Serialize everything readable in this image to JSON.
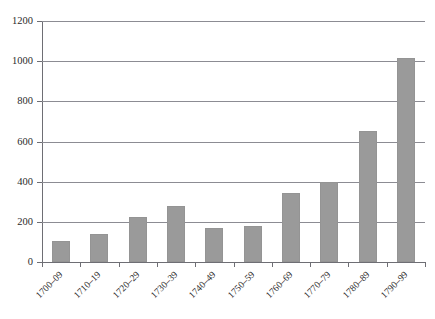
{
  "chart_data": {
    "type": "bar",
    "title": "",
    "subtitle": "",
    "xlabel": "",
    "ylabel": "",
    "ylim": [
      0,
      1200
    ],
    "yticks": [
      0,
      200,
      400,
      600,
      800,
      1000,
      1200
    ],
    "ytick_labels": [
      "0",
      "200",
      "400",
      "600",
      "800",
      "1000",
      "1200"
    ],
    "grid": true,
    "legend": "none",
    "bar_color": "#9a9a9a",
    "axis_color": "#6e6e74",
    "gridline_color": "#8c8c93",
    "categories": [
      "1700–09",
      "1710–19",
      "1720–29",
      "1730–39",
      "1740–49",
      "1750–59",
      "1760–69",
      "1770–79",
      "1780–89",
      "1790–99"
    ],
    "values": [
      105,
      140,
      225,
      280,
      170,
      180,
      345,
      400,
      650,
      1015
    ]
  }
}
